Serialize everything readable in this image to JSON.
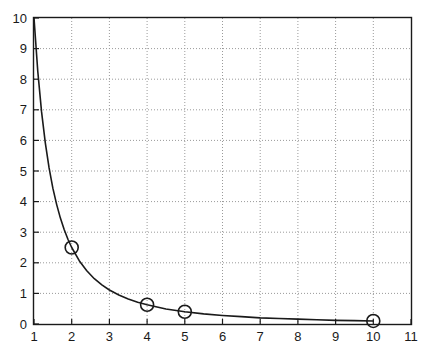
{
  "chart_data": {
    "type": "line",
    "title": "",
    "subtitle": "",
    "xlabel": "",
    "ylabel": "",
    "xlim": [
      1,
      11
    ],
    "ylim": [
      0,
      10
    ],
    "grid": true,
    "legend": null,
    "legend_position": "none",
    "xticks": [
      1,
      2,
      3,
      4,
      5,
      6,
      7,
      8,
      9,
      10,
      11
    ],
    "xtick_labels": [
      "1",
      "2",
      "3",
      "4",
      "5",
      "6",
      "7",
      "8",
      "9",
      "10",
      "11"
    ],
    "yticks": [
      0,
      1,
      2,
      3,
      4,
      5,
      6,
      7,
      8,
      9,
      10
    ],
    "ytick_labels": [
      "0",
      "1",
      "2",
      "3",
      "4",
      "5",
      "6",
      "7",
      "8",
      "9",
      "10"
    ],
    "series": [
      {
        "name": "curve",
        "kind": "line",
        "color": "#1a1a1a",
        "linewidth": 1.6,
        "marker": "none",
        "x": [
          1,
          1.1,
          1.2,
          1.3,
          1.4,
          1.5,
          1.6,
          1.7,
          1.8,
          1.9,
          2,
          2.2,
          2.4,
          2.6,
          2.8,
          3,
          3.25,
          3.5,
          3.75,
          4,
          4.5,
          5,
          5.5,
          6,
          6.5,
          7,
          7.5,
          8,
          8.5,
          9,
          9.5,
          10
        ],
        "y": [
          10,
          8.26,
          6.94,
          5.92,
          5.1,
          4.44,
          3.91,
          3.46,
          3.09,
          2.77,
          2.5,
          2.07,
          1.74,
          1.48,
          1.28,
          1.11,
          0.95,
          0.82,
          0.71,
          0.63,
          0.49,
          0.4,
          0.33,
          0.28,
          0.24,
          0.2,
          0.18,
          0.16,
          0.14,
          0.12,
          0.11,
          0.1
        ]
      },
      {
        "name": "markers",
        "kind": "scatter",
        "color": "#1a1a1a",
        "marker": "open-circle",
        "marker_size": 13,
        "x": [
          2,
          4,
          5,
          10
        ],
        "y": [
          2.5,
          0.63,
          0.4,
          0.1
        ]
      }
    ],
    "annotations": []
  },
  "axes": {
    "frame_color": "#1a1a1a",
    "grid_color": "#9a9a9a",
    "background": "#ffffff"
  }
}
